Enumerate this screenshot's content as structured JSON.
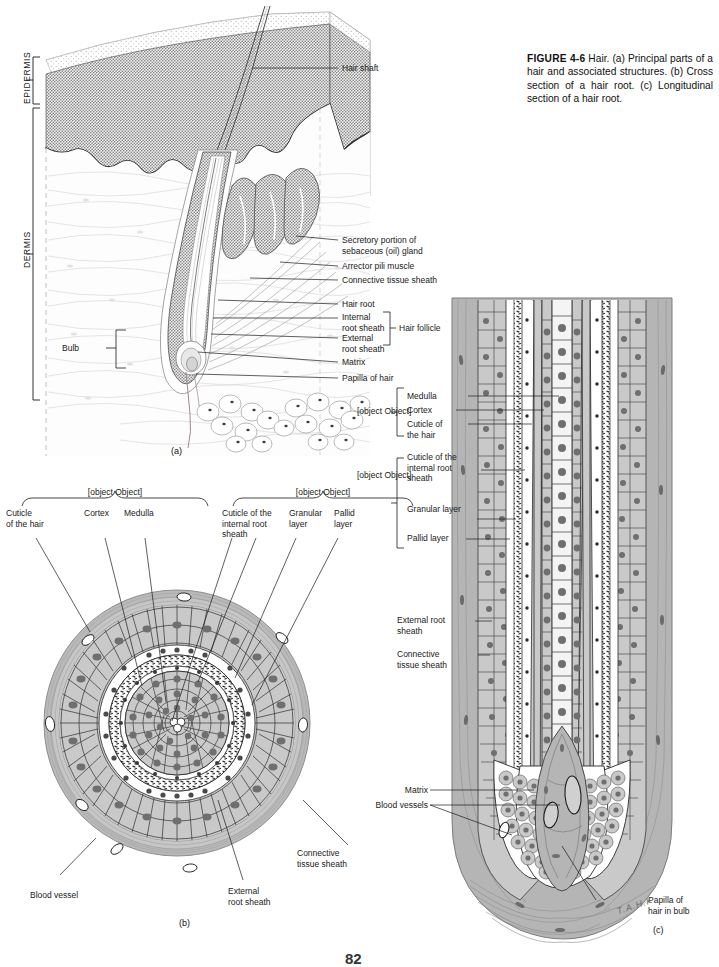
{
  "figure": {
    "number": "FIGURE 4-6",
    "title": "Hair.",
    "caption": "(a) Principal parts of a hair and associated structures. (b) Cross section of a hair root. (c) Longitudinal section of a hair root.",
    "caption_full": "FIGURE 4-6 Hair. (a) Principal parts of a hair and associated structures. (b) Cross section of a hair root. (c) Longitudinal section of a hair root."
  },
  "page_number": "82",
  "artist_signature": "T.A.H.K.",
  "colors": {
    "ink": "#1a1a1a",
    "cell_fill": "#c9c9c9",
    "nucleus": "#7d7d7d",
    "sheath_gray": "#b3b3b3",
    "dermis_tint": "#fcfcfc",
    "epidermis_stipple": "#9a9a9a",
    "background": "#ffffff"
  },
  "panels": [
    {
      "id": "a",
      "letter": "(a)",
      "name": "principal-parts-of-hair",
      "side_labels": [
        "EPIDERMIS",
        "DERMIS"
      ],
      "left_labels": [
        {
          "text": "Bulb",
          "name": "bulb"
        }
      ],
      "right_labels": [
        {
          "text": "Hair shaft",
          "name": "hair-shaft"
        },
        {
          "text": "Secretory portion of\nsebaceous (oil) gland",
          "name": "sebaceous-gland"
        },
        {
          "text": "Arrector pili muscle",
          "name": "arrector-pili-muscle"
        },
        {
          "text": "Connective tissue sheath",
          "name": "connective-tissue-sheath"
        },
        {
          "text": "Hair root",
          "name": "hair-root"
        },
        {
          "text": "Internal\nroot sheath",
          "name": "internal-root-sheath"
        },
        {
          "text": "External\nroot sheath",
          "name": "external-root-sheath"
        },
        {
          "text": "Matrix",
          "name": "matrix"
        },
        {
          "text": "Papilla of hair",
          "name": "papilla-of-hair"
        }
      ],
      "bracket_labels": [
        {
          "text": "Hair follicle",
          "name": "hair-follicle"
        }
      ]
    },
    {
      "id": "b",
      "letter": "(b)",
      "name": "cross-section-of-hair-root",
      "group_headers": [
        {
          "text": "Hair root",
          "name": "hair-root-group"
        },
        {
          "text": "Internal root sheath",
          "name": "internal-root-sheath-group"
        }
      ],
      "top_labels": [
        {
          "text": "Cuticle\nof the hair",
          "name": "cuticle-of-the-hair"
        },
        {
          "text": "Cortex",
          "name": "cortex"
        },
        {
          "text": "Medulla",
          "name": "medulla"
        },
        {
          "text": "Cuticle of the\ninternal root\nsheath",
          "name": "cuticle-of-internal-root-sheath"
        },
        {
          "text": "Granular\nlayer",
          "name": "granular-layer"
        },
        {
          "text": "Pallid\nlayer",
          "name": "pallid-layer"
        }
      ],
      "bottom_labels": [
        {
          "text": "Blood vessel",
          "name": "blood-vessel"
        },
        {
          "text": "External\nroot sheath",
          "name": "external-root-sheath"
        },
        {
          "text": "Connective\ntissue sheath",
          "name": "connective-tissue-sheath"
        }
      ]
    },
    {
      "id": "c",
      "letter": "(c)",
      "name": "longitudinal-section-of-hair-root",
      "group_headers": [
        {
          "text": "Hair root",
          "name": "hair-root-group"
        },
        {
          "text": "Internal\nroot\nsheath",
          "name": "internal-root-sheath-group"
        }
      ],
      "labels": [
        {
          "text": "Medulla",
          "name": "medulla"
        },
        {
          "text": "Cortex",
          "name": "cortex"
        },
        {
          "text": "Cuticle of\nthe hair",
          "name": "cuticle-of-the-hair"
        },
        {
          "text": "Cuticle of the\ninternal root\nsheath",
          "name": "cuticle-of-internal-root-sheath"
        },
        {
          "text": "Granular layer",
          "name": "granular-layer"
        },
        {
          "text": "Pallid layer",
          "name": "pallid-layer"
        },
        {
          "text": "External root\nsheath",
          "name": "external-root-sheath"
        },
        {
          "text": "Connective\ntissue sheath",
          "name": "connective-tissue-sheath"
        },
        {
          "text": "Matrix",
          "name": "matrix"
        },
        {
          "text": "Blood vessels",
          "name": "blood-vessels"
        },
        {
          "text": "Papilla of\nhair in bulb",
          "name": "papilla-of-hair-in-bulb"
        }
      ]
    }
  ]
}
